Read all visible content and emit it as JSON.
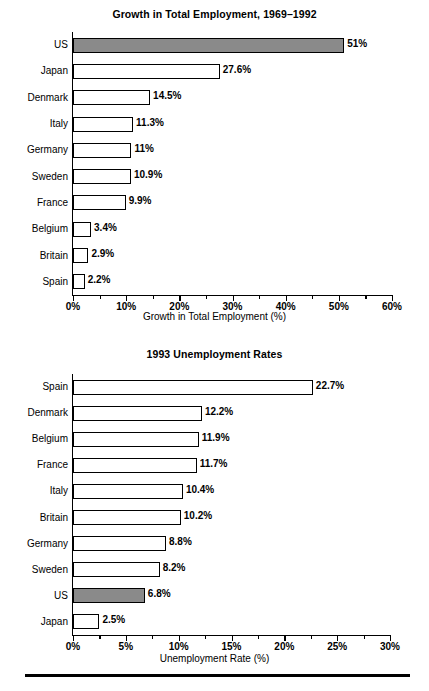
{
  "page": {
    "background": "#ffffff",
    "highlight_color": "#8a8a8a",
    "line_color": "#000000"
  },
  "chart_data": [
    {
      "id": "growth",
      "type": "bar",
      "orientation": "horizontal",
      "title": "Growth in Total Employment, 1969–1992",
      "xlabel": "Growth in Total Employment (%)",
      "ylabel": "",
      "xlim": [
        0,
        60
      ],
      "xtick_step": 10,
      "xminor_step": 5,
      "grid": false,
      "legend": false,
      "highlight_category": "US",
      "xticks": [
        "0%",
        "10%",
        "20%",
        "30%",
        "40%",
        "50%",
        "60%"
      ],
      "categories": [
        "US",
        "Japan",
        "Denmark",
        "Italy",
        "Germany",
        "Sweden",
        "France",
        "Belgium",
        "Britain",
        "Spain"
      ],
      "values": [
        51,
        27.6,
        14.5,
        11.3,
        11,
        10.9,
        9.9,
        3.4,
        2.9,
        2.2
      ],
      "data_labels": [
        "51%",
        "27.6%",
        "14.5%",
        "11.3%",
        "11%",
        "10.9%",
        "9.9%",
        "3.4%",
        "2.9%",
        "2.2%"
      ]
    },
    {
      "id": "unemployment",
      "type": "bar",
      "orientation": "horizontal",
      "title": "1993 Unemployment Rates",
      "xlabel": "Unemployment Rate (%)",
      "ylabel": "",
      "xlim": [
        0,
        30
      ],
      "xtick_step": 5,
      "xminor_step": 2.5,
      "grid": false,
      "legend": false,
      "highlight_category": "US",
      "xticks": [
        "0%",
        "5%",
        "10%",
        "15%",
        "20%",
        "25%",
        "30%"
      ],
      "categories": [
        "Spain",
        "Denmark",
        "Belgium",
        "France",
        "Italy",
        "Britain",
        "Germany",
        "Sweden",
        "US",
        "Japan"
      ],
      "values": [
        22.7,
        12.2,
        11.9,
        11.7,
        10.4,
        10.2,
        8.8,
        8.2,
        6.8,
        2.5
      ],
      "data_labels": [
        "22.7%",
        "12.2%",
        "11.9%",
        "11.7%",
        "10.4%",
        "10.2%",
        "8.8%",
        "8.2%",
        "6.8%",
        "2.5%"
      ]
    }
  ]
}
